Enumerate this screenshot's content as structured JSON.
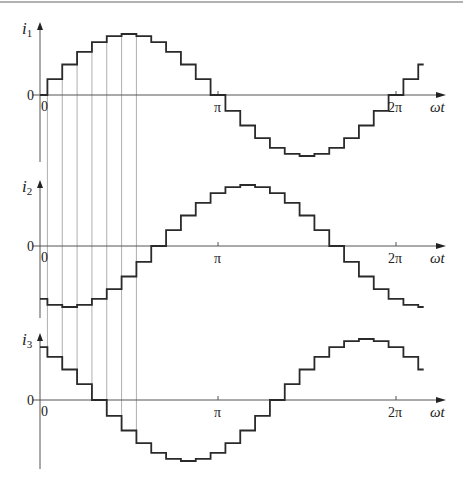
{
  "figure": {
    "colors": {
      "waveform": "#2a2a2a",
      "axis": "#555555",
      "grid": "#9a9a9a",
      "rule": "#666666"
    },
    "x_axis_label": "ωt",
    "tick_labels": {
      "zero": "0",
      "pi": "π",
      "two_pi": "2π"
    },
    "step_degrees": 15,
    "panels": [
      {
        "name": "i1",
        "label_main": "i",
        "label_sub": "1",
        "phase_deg": 0,
        "zero_y": 95,
        "axis_top": 22,
        "axis_bottom": 162,
        "amp": 61,
        "end_deg": 390
      },
      {
        "name": "i2",
        "label_main": "i",
        "label_sub": "2",
        "phase_deg": -120,
        "zero_y": 246,
        "axis_top": 180,
        "axis_bottom": 318,
        "amp": 61,
        "end_deg": 390
      },
      {
        "name": "i3",
        "label_main": "i",
        "label_sub": "3",
        "phase_deg": 120,
        "zero_y": 400,
        "axis_top": 333,
        "axis_bottom": 469,
        "amp": 61,
        "end_deg": 390
      }
    ],
    "guide_lines_deg": [
      7.5,
      22.5,
      37.5,
      52.5,
      67.5,
      82.5,
      97.5
    ]
  },
  "chart_data": {
    "type": "line",
    "title": "",
    "xlabel": "ωt",
    "x_ticks": [
      "0",
      "π",
      "2π"
    ],
    "step_width_deg": 15,
    "series": [
      {
        "name": "i1",
        "formula": "sin(ωt)",
        "levels": [
          0,
          0.259,
          0.5,
          0.707,
          0.866,
          0.966,
          1,
          0.966,
          0.866,
          0.707,
          0.5,
          0.259,
          0,
          -0.259,
          -0.5,
          -0.707,
          -0.866,
          -0.966,
          -1,
          -0.966,
          -0.866,
          -0.707,
          -0.5,
          -0.259,
          0,
          0.259,
          0.5
        ]
      },
      {
        "name": "i2",
        "formula": "sin(ωt - 120°)",
        "levels": [
          -0.866,
          -0.966,
          -1,
          -0.966,
          -0.866,
          -0.707,
          -0.5,
          -0.259,
          0,
          0.259,
          0.5,
          0.707,
          0.866,
          0.966,
          1,
          0.966,
          0.866,
          0.707,
          0.5,
          0.259,
          0,
          -0.259,
          -0.5,
          -0.707,
          -0.866,
          -0.966,
          -1
        ]
      },
      {
        "name": "i3",
        "formula": "sin(ωt + 120°)",
        "levels": [
          0.866,
          0.707,
          0.5,
          0.259,
          0,
          -0.259,
          -0.5,
          -0.707,
          -0.866,
          -0.966,
          -1,
          -0.966,
          -0.866,
          -0.707,
          -0.5,
          -0.259,
          0,
          0.259,
          0.5,
          0.707,
          0.866,
          0.966,
          1,
          0.966,
          0.866,
          0.707,
          0.5
        ]
      }
    ]
  }
}
